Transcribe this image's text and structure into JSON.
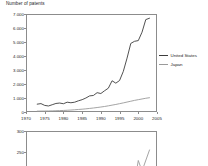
{
  "chart_data": [
    {
      "id": "top",
      "type": "line",
      "title": "Number of patents",
      "xlabel": "",
      "ylabel": "Number of patents",
      "xlim": [
        1970,
        2005
      ],
      "ylim": [
        0,
        7000
      ],
      "xticks": [
        1970,
        1975,
        1980,
        1985,
        1990,
        1995,
        2000,
        2005
      ],
      "xtick_labels": [
        "1970",
        "1975",
        "1980",
        "1985",
        "1990",
        "1995",
        "2000",
        "2005"
      ],
      "yticks": [
        0,
        1000,
        2000,
        3000,
        4000,
        5000,
        6000,
        7000
      ],
      "ytick_labels": [
        "0",
        "1.000",
        "2.000",
        "3.000",
        "4.000",
        "5.000",
        "6.000",
        "7.000"
      ],
      "grid": false,
      "legend_position": "right",
      "x": [
        1973,
        1974,
        1975,
        1976,
        1977,
        1978,
        1979,
        1980,
        1981,
        1982,
        1983,
        1984,
        1985,
        1986,
        1987,
        1988,
        1989,
        1990,
        1991,
        1992,
        1993,
        1994,
        1995,
        1996,
        1997,
        1998,
        1999,
        2000,
        2001,
        2002,
        2003
      ],
      "series": [
        {
          "name": "United States",
          "color": "#3d3d3d",
          "values": [
            560,
            600,
            470,
            430,
            520,
            610,
            640,
            590,
            700,
            660,
            700,
            800,
            880,
            1000,
            1150,
            1180,
            1380,
            1320,
            1520,
            1700,
            2230,
            2060,
            2250,
            2900,
            3850,
            4900,
            5050,
            5100,
            5700,
            6600,
            6700
          ]
        },
        {
          "name": "Japan",
          "color": "#9a9a9a",
          "values": [
            60,
            65,
            70,
            75,
            80,
            90,
            100,
            110,
            125,
            140,
            160,
            180,
            200,
            225,
            255,
            285,
            320,
            355,
            395,
            440,
            490,
            540,
            595,
            650,
            710,
            770,
            830,
            880,
            930,
            980,
            1020
          ]
        }
      ]
    },
    {
      "id": "bottom",
      "type": "line",
      "title": "",
      "xlabel": "",
      "ylabel": "",
      "ylim": [
        0,
        300
      ],
      "yticks": [
        250,
        300
      ],
      "ytick_labels": [
        "250",
        "300"
      ],
      "grid": false,
      "clipped": true,
      "x": [
        1973,
        1978,
        1983,
        1988,
        1993,
        1996,
        1998,
        1999,
        2000,
        2001,
        2003
      ],
      "series": [
        {
          "name": "series-1",
          "color": "#9a9a9a",
          "values": [
            2,
            3,
            4,
            6,
            9,
            20,
            60,
            175,
            230,
            205,
            255
          ]
        }
      ]
    }
  ],
  "legend": {
    "items": [
      {
        "label": "United States",
        "color": "#3d3d3d"
      },
      {
        "label": "Japan",
        "color": "#9a9a9a"
      }
    ]
  }
}
